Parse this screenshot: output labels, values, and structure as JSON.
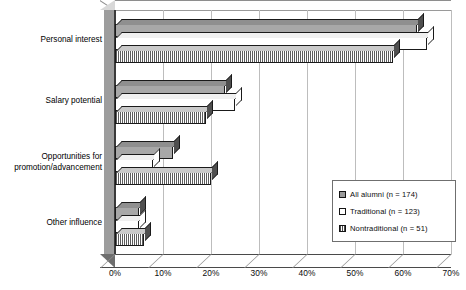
{
  "chart_data": {
    "type": "bar",
    "orientation": "horizontal",
    "title": "",
    "xlabel": "",
    "ylabel": "",
    "xlim": [
      0,
      70
    ],
    "xtick_labels": [
      "0%",
      "10%",
      "20%",
      "30%",
      "40%",
      "50%",
      "60%",
      "70%"
    ],
    "xticks": [
      0,
      10,
      20,
      30,
      40,
      50,
      60,
      70
    ],
    "grid": true,
    "legend_position": "bottom-right",
    "style": "3d-bar",
    "categories": [
      "Personal interest",
      "Salary potential",
      "Opportunities for promotion/advancement",
      "Other influence"
    ],
    "series": [
      {
        "name": "All alumni (n = 174)",
        "key": "all",
        "values": [
          63,
          23,
          12,
          5
        ]
      },
      {
        "name": "Traditional (n = 123)",
        "key": "trad",
        "values": [
          65,
          25,
          8,
          5
        ]
      },
      {
        "name": "Nontraditional (n = 51)",
        "key": "nontrad",
        "values": [
          58,
          19,
          20,
          6
        ]
      }
    ]
  },
  "axis": {
    "ticks": [
      {
        "label": "0%",
        "value": 0
      },
      {
        "label": "10%",
        "value": 10
      },
      {
        "label": "20%",
        "value": 20
      },
      {
        "label": "30%",
        "value": 30
      },
      {
        "label": "40%",
        "value": 40
      },
      {
        "label": "50%",
        "value": 50
      },
      {
        "label": "60%",
        "value": 60
      },
      {
        "label": "70%",
        "value": 70
      }
    ]
  },
  "categories": [
    {
      "line1": "Personal interest",
      "line2": ""
    },
    {
      "line1": "Salary potential",
      "line2": ""
    },
    {
      "line1": "Opportunities for",
      "line2": "promotion/advancement"
    },
    {
      "line1": "Other influence",
      "line2": ""
    }
  ],
  "legend": {
    "items": [
      {
        "label": "All alumni (n = 174)",
        "key_class": "k-all"
      },
      {
        "label": "Traditional (n = 123)",
        "key_class": "k-trad"
      },
      {
        "label": "Nontraditional (n = 51)",
        "key_class": "k-nontrad"
      }
    ]
  },
  "colors": {
    "all_alumni": "#a8a8a8",
    "traditional": "#ffffff",
    "nontraditional": "#5d5d5d",
    "grid": "#bdbdbd",
    "axis": "#3b3b3b",
    "sidewall": "#9d9d9d"
  }
}
